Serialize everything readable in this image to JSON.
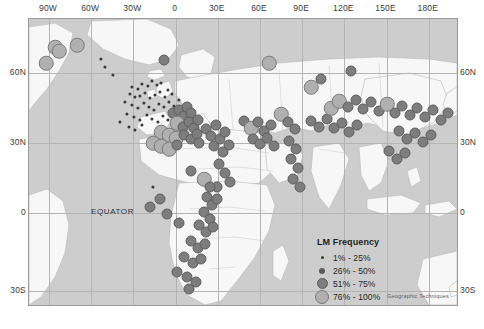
{
  "figure": {
    "credit": "Geographic Techniques",
    "equator_label": "EQUATOR"
  },
  "axes": {
    "lon_labels": [
      "90W",
      "60W",
      "30W",
      "0",
      "30E",
      "60E",
      "90E",
      "120E",
      "150E",
      "180E"
    ],
    "lat_labels_left": [
      "60N",
      "30N",
      "0",
      "30S"
    ],
    "lat_labels_right": [
      "60N",
      "30N",
      "0",
      "30S"
    ]
  },
  "legend": {
    "title": "LM Frequency",
    "items": [
      {
        "label": "1% - 25%",
        "class": "c1",
        "size": 3
      },
      {
        "label": "26% - 50%",
        "class": "c2",
        "size": 6
      },
      {
        "label": "51% - 75%",
        "class": "c3",
        "size": 9
      },
      {
        "label": "76% - 100%",
        "class": "c4",
        "size": 12
      }
    ]
  },
  "colors": {
    "ocean": "#cdcdcd",
    "land": "#f6f6f6",
    "border": "#9a9a9a",
    "graticule": "#b4b4b4",
    "class1": "#3a3a3a",
    "class2": "#5a5a5a",
    "class3": "#7d7d7d",
    "class4": "#b0b0b0"
  },
  "chart_data": {
    "type": "scatter",
    "title": "LM Frequency",
    "xlabel": "Longitude",
    "ylabel": "Latitude",
    "xlim": [
      -105,
      195
    ],
    "ylim": [
      -42,
      78
    ],
    "grid": true,
    "legend": "inset-lower-right",
    "size_classes": [
      {
        "name": "1% - 25%",
        "px": 3
      },
      {
        "name": "26% - 50%",
        "px": 6
      },
      {
        "name": "51% - 75%",
        "px": 9
      },
      {
        "name": "76% - 100%",
        "px": 12
      }
    ],
    "points": [
      {
        "x": 54,
        "y": 46,
        "c": 4
      },
      {
        "x": 76,
        "y": 44,
        "c": 4
      },
      {
        "x": 45,
        "y": 62,
        "c": 4
      },
      {
        "x": 163,
        "y": 59,
        "c": 3
      },
      {
        "x": 131,
        "y": 86,
        "c": 1
      },
      {
        "x": 137,
        "y": 88,
        "c": 1
      },
      {
        "x": 141,
        "y": 83,
        "c": 1
      },
      {
        "x": 147,
        "y": 85,
        "c": 1
      },
      {
        "x": 151,
        "y": 80,
        "c": 1
      },
      {
        "x": 156,
        "y": 84,
        "c": 1
      },
      {
        "x": 160,
        "y": 82,
        "c": 1
      },
      {
        "x": 129,
        "y": 93,
        "c": 1
      },
      {
        "x": 134,
        "y": 96,
        "c": 1
      },
      {
        "x": 139,
        "y": 95,
        "c": 1
      },
      {
        "x": 144,
        "y": 92,
        "c": 1
      },
      {
        "x": 149,
        "y": 97,
        "c": 1
      },
      {
        "x": 154,
        "y": 94,
        "c": 1
      },
      {
        "x": 159,
        "y": 91,
        "c": 1
      },
      {
        "x": 164,
        "y": 96,
        "c": 1
      },
      {
        "x": 167,
        "y": 89,
        "c": 1
      },
      {
        "x": 171,
        "y": 93,
        "c": 1
      },
      {
        "x": 124,
        "y": 101,
        "c": 1
      },
      {
        "x": 131,
        "y": 104,
        "c": 1
      },
      {
        "x": 137,
        "y": 107,
        "c": 1
      },
      {
        "x": 143,
        "y": 102,
        "c": 1
      },
      {
        "x": 148,
        "y": 106,
        "c": 1
      },
      {
        "x": 153,
        "y": 109,
        "c": 1
      },
      {
        "x": 158,
        "y": 103,
        "c": 1
      },
      {
        "x": 163,
        "y": 106,
        "c": 1
      },
      {
        "x": 168,
        "y": 101,
        "c": 1
      },
      {
        "x": 173,
        "y": 105,
        "c": 1
      },
      {
        "x": 178,
        "y": 99,
        "c": 1
      },
      {
        "x": 126,
        "y": 113,
        "c": 1
      },
      {
        "x": 133,
        "y": 116,
        "c": 1
      },
      {
        "x": 139,
        "y": 119,
        "c": 1
      },
      {
        "x": 146,
        "y": 114,
        "c": 1
      },
      {
        "x": 151,
        "y": 118,
        "c": 1
      },
      {
        "x": 157,
        "y": 121,
        "c": 1
      },
      {
        "x": 162,
        "y": 115,
        "c": 1
      },
      {
        "x": 167,
        "y": 119,
        "c": 1
      },
      {
        "x": 119,
        "y": 121,
        "c": 1
      },
      {
        "x": 128,
        "y": 126,
        "c": 1
      },
      {
        "x": 134,
        "y": 129,
        "c": 1
      },
      {
        "x": 141,
        "y": 124,
        "c": 1
      },
      {
        "x": 172,
        "y": 112,
        "c": 3
      },
      {
        "x": 178,
        "y": 109,
        "c": 3
      },
      {
        "x": 183,
        "y": 115,
        "c": 3
      },
      {
        "x": 186,
        "y": 106,
        "c": 3
      },
      {
        "x": 190,
        "y": 112,
        "c": 3
      },
      {
        "x": 176,
        "y": 122,
        "c": 4
      },
      {
        "x": 182,
        "y": 126,
        "c": 3
      },
      {
        "x": 188,
        "y": 121,
        "c": 3
      },
      {
        "x": 193,
        "y": 127,
        "c": 3
      },
      {
        "x": 197,
        "y": 119,
        "c": 3
      },
      {
        "x": 160,
        "y": 131,
        "c": 4
      },
      {
        "x": 168,
        "y": 134,
        "c": 4
      },
      {
        "x": 175,
        "y": 137,
        "c": 4
      },
      {
        "x": 183,
        "y": 134,
        "c": 3
      },
      {
        "x": 190,
        "y": 138,
        "c": 3
      },
      {
        "x": 196,
        "y": 133,
        "c": 3
      },
      {
        "x": 152,
        "y": 142,
        "c": 4
      },
      {
        "x": 160,
        "y": 145,
        "c": 4
      },
      {
        "x": 168,
        "y": 148,
        "c": 4
      },
      {
        "x": 176,
        "y": 144,
        "c": 3
      },
      {
        "x": 198,
        "y": 142,
        "c": 3
      },
      {
        "x": 205,
        "y": 128,
        "c": 3
      },
      {
        "x": 210,
        "y": 135,
        "c": 3
      },
      {
        "x": 215,
        "y": 124,
        "c": 3
      },
      {
        "x": 213,
        "y": 145,
        "c": 3
      },
      {
        "x": 219,
        "y": 138,
        "c": 3
      },
      {
        "x": 224,
        "y": 131,
        "c": 3
      },
      {
        "x": 222,
        "y": 151,
        "c": 3
      },
      {
        "x": 228,
        "y": 144,
        "c": 3
      },
      {
        "x": 218,
        "y": 163,
        "c": 3
      },
      {
        "x": 224,
        "y": 172,
        "c": 3
      },
      {
        "x": 229,
        "y": 181,
        "c": 3
      },
      {
        "x": 216,
        "y": 186,
        "c": 3
      },
      {
        "x": 152,
        "y": 186,
        "c": 1
      },
      {
        "x": 159,
        "y": 198,
        "c": 3
      },
      {
        "x": 149,
        "y": 206,
        "c": 3
      },
      {
        "x": 166,
        "y": 213,
        "c": 3
      },
      {
        "x": 178,
        "y": 222,
        "c": 3
      },
      {
        "x": 190,
        "y": 170,
        "c": 3
      },
      {
        "x": 203,
        "y": 178,
        "c": 4
      },
      {
        "x": 209,
        "y": 186,
        "c": 3
      },
      {
        "x": 206,
        "y": 196,
        "c": 3
      },
      {
        "x": 211,
        "y": 204,
        "c": 3
      },
      {
        "x": 216,
        "y": 198,
        "c": 3
      },
      {
        "x": 203,
        "y": 211,
        "c": 3
      },
      {
        "x": 209,
        "y": 218,
        "c": 3
      },
      {
        "x": 198,
        "y": 224,
        "c": 3
      },
      {
        "x": 205,
        "y": 231,
        "c": 3
      },
      {
        "x": 212,
        "y": 226,
        "c": 3
      },
      {
        "x": 190,
        "y": 240,
        "c": 3
      },
      {
        "x": 197,
        "y": 247,
        "c": 3
      },
      {
        "x": 204,
        "y": 243,
        "c": 3
      },
      {
        "x": 183,
        "y": 256,
        "c": 3
      },
      {
        "x": 192,
        "y": 262,
        "c": 3
      },
      {
        "x": 200,
        "y": 258,
        "c": 3
      },
      {
        "x": 176,
        "y": 271,
        "c": 3
      },
      {
        "x": 186,
        "y": 276,
        "c": 3
      },
      {
        "x": 195,
        "y": 281,
        "c": 3
      },
      {
        "x": 188,
        "y": 288,
        "c": 3
      },
      {
        "x": 243,
        "y": 120,
        "c": 3
      },
      {
        "x": 250,
        "y": 127,
        "c": 4
      },
      {
        "x": 257,
        "y": 121,
        "c": 3
      },
      {
        "x": 263,
        "y": 130,
        "c": 3
      },
      {
        "x": 270,
        "y": 124,
        "c": 3
      },
      {
        "x": 252,
        "y": 138,
        "c": 3
      },
      {
        "x": 259,
        "y": 143,
        "c": 3
      },
      {
        "x": 266,
        "y": 137,
        "c": 3
      },
      {
        "x": 273,
        "y": 145,
        "c": 3
      },
      {
        "x": 280,
        "y": 113,
        "c": 4
      },
      {
        "x": 287,
        "y": 121,
        "c": 3
      },
      {
        "x": 294,
        "y": 128,
        "c": 3
      },
      {
        "x": 288,
        "y": 140,
        "c": 3
      },
      {
        "x": 295,
        "y": 148,
        "c": 3
      },
      {
        "x": 290,
        "y": 158,
        "c": 3
      },
      {
        "x": 297,
        "y": 167,
        "c": 3
      },
      {
        "x": 292,
        "y": 178,
        "c": 3
      },
      {
        "x": 299,
        "y": 186,
        "c": 3
      },
      {
        "x": 310,
        "y": 120,
        "c": 3
      },
      {
        "x": 318,
        "y": 126,
        "c": 3
      },
      {
        "x": 326,
        "y": 118,
        "c": 3
      },
      {
        "x": 333,
        "y": 127,
        "c": 3
      },
      {
        "x": 341,
        "y": 122,
        "c": 3
      },
      {
        "x": 348,
        "y": 131,
        "c": 3
      },
      {
        "x": 356,
        "y": 124,
        "c": 3
      },
      {
        "x": 330,
        "y": 107,
        "c": 4
      },
      {
        "x": 338,
        "y": 100,
        "c": 4
      },
      {
        "x": 347,
        "y": 106,
        "c": 3
      },
      {
        "x": 355,
        "y": 99,
        "c": 3
      },
      {
        "x": 362,
        "y": 108,
        "c": 3
      },
      {
        "x": 370,
        "y": 101,
        "c": 3
      },
      {
        "x": 378,
        "y": 110,
        "c": 3
      },
      {
        "x": 386,
        "y": 103,
        "c": 4
      },
      {
        "x": 394,
        "y": 112,
        "c": 3
      },
      {
        "x": 401,
        "y": 105,
        "c": 3
      },
      {
        "x": 409,
        "y": 114,
        "c": 3
      },
      {
        "x": 416,
        "y": 107,
        "c": 3
      },
      {
        "x": 424,
        "y": 116,
        "c": 3
      },
      {
        "x": 432,
        "y": 109,
        "c": 3
      },
      {
        "x": 440,
        "y": 119,
        "c": 3
      },
      {
        "x": 447,
        "y": 112,
        "c": 3
      },
      {
        "x": 398,
        "y": 130,
        "c": 3
      },
      {
        "x": 406,
        "y": 138,
        "c": 3
      },
      {
        "x": 414,
        "y": 132,
        "c": 3
      },
      {
        "x": 422,
        "y": 141,
        "c": 3
      },
      {
        "x": 430,
        "y": 134,
        "c": 3
      },
      {
        "x": 388,
        "y": 150,
        "c": 3
      },
      {
        "x": 396,
        "y": 158,
        "c": 3
      },
      {
        "x": 404,
        "y": 152,
        "c": 3
      },
      {
        "x": 310,
        "y": 86,
        "c": 4
      },
      {
        "x": 320,
        "y": 78,
        "c": 3
      },
      {
        "x": 268,
        "y": 62,
        "c": 4
      },
      {
        "x": 350,
        "y": 70,
        "c": 3
      },
      {
        "x": 58,
        "y": 50,
        "c": 4
      },
      {
        "x": 100,
        "y": 58,
        "c": 1
      },
      {
        "x": 104,
        "y": 66,
        "c": 1
      },
      {
        "x": 112,
        "y": 74,
        "c": 1
      }
    ]
  }
}
